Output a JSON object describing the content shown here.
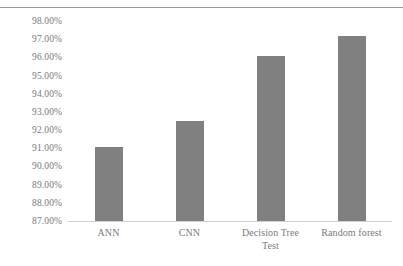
{
  "chart_data": {
    "type": "bar",
    "title": "",
    "subtitle": "",
    "xlabel": "Test",
    "ylabel": "",
    "categories": [
      "ANN",
      "CNN",
      "Decision Tree",
      "Random forest"
    ],
    "values": [
      91.05,
      92.5,
      96.1,
      97.2
    ],
    "value_labels": [
      "91.05%",
      "92.50%",
      "96.10%",
      "97.20%"
    ],
    "series": [
      {
        "name": "Test",
        "values": [
          91.05,
          92.5,
          96.1,
          97.2
        ]
      }
    ],
    "ylim": [
      87.0,
      98.0
    ],
    "ytick_values": [
      87.0,
      88.0,
      89.0,
      90.0,
      91.0,
      92.0,
      93.0,
      94.0,
      95.0,
      96.0,
      97.0,
      98.0
    ],
    "ytick_labels": [
      "87.00%",
      "88.00%",
      "89.00%",
      "90.00%",
      "91.00%",
      "92.00%",
      "93.00%",
      "94.00%",
      "95.00%",
      "96.00%",
      "97.00%",
      "98.00%"
    ],
    "grid": false,
    "legend": false,
    "legend_position": "none",
    "bar_color": "#808080",
    "axis_color": "#d0d0d0",
    "tick_label_color": "#7a7a7a"
  },
  "decorations": {
    "top_rule_color": "#9a9a9a"
  }
}
